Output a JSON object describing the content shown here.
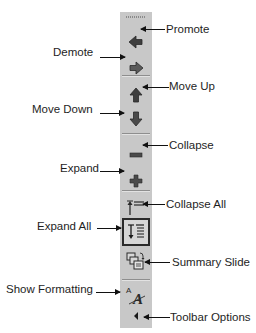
{
  "diagram": {
    "toolbar_buttons": [
      {
        "id": "promote",
        "label": "Promote",
        "icon": "left-arrow-icon",
        "label_side": "right"
      },
      {
        "id": "demote",
        "label": "Demote",
        "icon": "right-arrow-icon",
        "label_side": "left"
      },
      {
        "id": "move-up",
        "label": "Move Up",
        "icon": "up-arrow-icon",
        "label_side": "right"
      },
      {
        "id": "move-down",
        "label": "Move Down",
        "icon": "down-arrow-icon",
        "label_side": "left"
      },
      {
        "id": "collapse",
        "label": "Collapse",
        "icon": "minus-icon",
        "label_side": "right"
      },
      {
        "id": "expand",
        "label": "Expand",
        "icon": "plus-icon",
        "label_side": "left"
      },
      {
        "id": "collapse-all",
        "label": "Collapse All",
        "icon": "collapse-all-icon",
        "label_side": "right"
      },
      {
        "id": "expand-all",
        "label": "Expand All",
        "icon": "expand-all-icon",
        "label_side": "left",
        "state": "pressed"
      },
      {
        "id": "summary-slide",
        "label": "Summary Slide",
        "icon": "summary-slide-icon",
        "label_side": "right"
      },
      {
        "id": "show-formatting",
        "label": "Show Formatting",
        "icon": "show-formatting-icon",
        "label_side": "left"
      },
      {
        "id": "toolbar-options",
        "label": "Toolbar Options",
        "icon": "toolbar-options-icon",
        "label_side": "right"
      }
    ]
  },
  "colors": {
    "toolbar_bg": "#c8c8c8",
    "icon_dark": "#3a3a3a",
    "text": "#1e1e1e",
    "background": "#ffffff"
  }
}
